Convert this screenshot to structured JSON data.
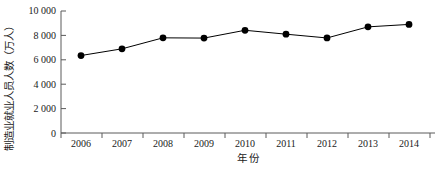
{
  "chart_data": {
    "type": "line",
    "title": "",
    "xlabel": "年  份",
    "ylabel": "制造业就业人员人数（万人）",
    "categories": [
      "2006",
      "2007",
      "2008",
      "2009",
      "2010",
      "2011",
      "2012",
      "2013",
      "2014"
    ],
    "x": [
      2006,
      2007,
      2008,
      2009,
      2010,
      2011,
      2012,
      2013,
      2014
    ],
    "values": [
      6350,
      6900,
      7800,
      7780,
      8420,
      8100,
      7790,
      8700,
      8900
    ],
    "series": [
      {
        "name": "制造业就业人员人数",
        "values": [
          6350,
          6900,
          7800,
          7780,
          8420,
          8100,
          7790,
          8700,
          8900
        ]
      }
    ],
    "ylim": [
      0,
      10000
    ],
    "yticks": [
      0,
      2000,
      4000,
      6000,
      8000,
      10000
    ],
    "ytick_labels": [
      "0",
      "2 000",
      "4 000",
      "6 000",
      "8 000",
      "10 000"
    ],
    "grid": false,
    "legend": "none",
    "marker": "filled-circle",
    "line_color": "#000000",
    "marker_color": "#000000",
    "axis_color": "#5a5a5a"
  },
  "axes": {
    "y_title": "制造业就业人员人数（万人）",
    "x_title": "年  份",
    "y_tick_labels": [
      "10 000",
      "8 000",
      "6 000",
      "4 000",
      "2 000",
      "0"
    ],
    "x_tick_labels": [
      "2006",
      "2007",
      "2008",
      "2009",
      "2010",
      "2011",
      "2012",
      "2013",
      "2014"
    ]
  },
  "colors": {
    "background": "#ffffff",
    "line": "#000000",
    "marker": "#000000",
    "axis": "#5a5a5a",
    "text": "#1a1a1a"
  }
}
